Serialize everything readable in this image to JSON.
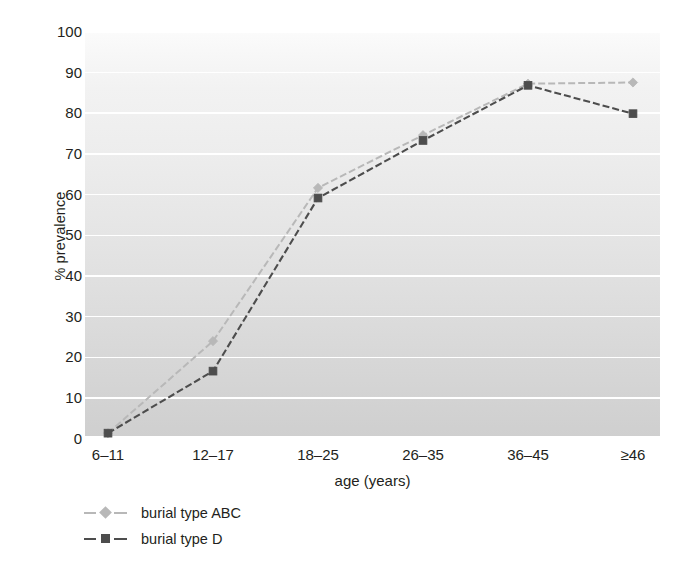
{
  "chart_data": {
    "type": "line",
    "title": "",
    "xlabel": "age (years)",
    "ylabel": "% prevalence",
    "categories": [
      "6–11",
      "12–17",
      "18–25",
      "26–35",
      "36–45",
      "≥46"
    ],
    "ylim": [
      0,
      100
    ],
    "yticks": [
      0,
      10,
      20,
      30,
      40,
      50,
      60,
      70,
      80,
      90,
      100
    ],
    "ytick_labels": [
      "0",
      "10",
      "20",
      "30",
      "40",
      "50",
      "60",
      "70",
      "80",
      "90",
      "100"
    ],
    "grid": "horizontal",
    "legend_position": "bottom-left",
    "series": [
      {
        "name": "burial type ABC",
        "color": "#b8b8b8",
        "marker": "diamond",
        "linestyle": "dashed",
        "values": [
          1.0,
          23.7,
          61.5,
          74.5,
          87.2,
          87.5
        ]
      },
      {
        "name": "burial type D",
        "color": "#4d4d4d",
        "marker": "square",
        "linestyle": "dashed",
        "values": [
          1.0,
          16.3,
          59.0,
          73.2,
          86.8,
          79.8
        ]
      }
    ]
  },
  "axes": {
    "y_title": "% prevalence",
    "x_title": "age (years)",
    "y_tick_labels": [
      "100",
      "90",
      "80",
      "70",
      "60",
      "50",
      "40",
      "30",
      "20",
      "10",
      "0"
    ],
    "x_tick_labels": [
      "6–11",
      "12–17",
      "18–25",
      "26–35",
      "36–45",
      "≥46"
    ]
  },
  "legend": {
    "items": [
      {
        "label": "burial type ABC",
        "color": "#b8b8b8",
        "marker": "diamond"
      },
      {
        "label": "burial type D",
        "color": "#4d4d4d",
        "marker": "square"
      }
    ]
  },
  "colors": {
    "series_abc": "#b8b8b8",
    "series_d": "#4d4d4d",
    "gridline": "#ffffff",
    "text": "#231f20",
    "plot_background_top": "#fbfbfb",
    "plot_background_bottom": "#cfcfcf"
  }
}
